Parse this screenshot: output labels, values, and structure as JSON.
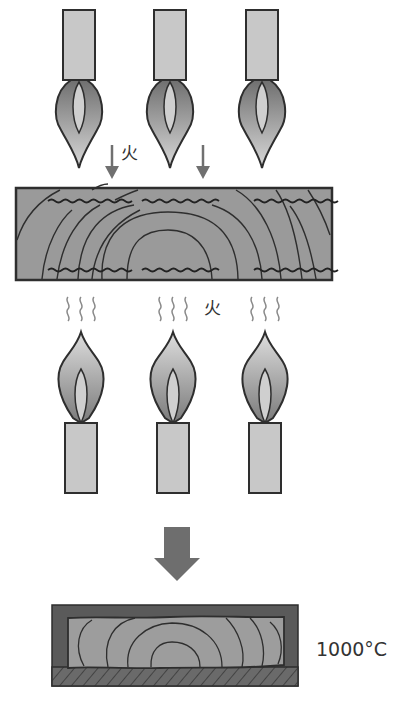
{
  "diagram": {
    "top_stage": {
      "burners": [
        {
          "id": "top-burner-1",
          "cx": 79
        },
        {
          "id": "top-burner-2",
          "cx": 170
        },
        {
          "id": "top-burner-3",
          "cx": 262
        }
      ],
      "fire_label": "火",
      "arrows": [
        {
          "x": 112
        },
        {
          "x": 203
        }
      ]
    },
    "wood_block": {
      "label": "wood plank with grain",
      "fill": "#999999"
    },
    "bottom_stage": {
      "candles": [
        {
          "id": "bottom-candle-1",
          "cx": 81
        },
        {
          "id": "bottom-candle-2",
          "cx": 173
        },
        {
          "id": "bottom-candle-3",
          "cx": 265
        }
      ],
      "fire_label": "火",
      "heat_wave_groups": 3
    },
    "transition_arrow": {
      "direction": "down",
      "color": "#6e6e6e"
    },
    "result": {
      "label": "carbonized wood",
      "temperature": "1000°C",
      "outer_color": "#5a5a5a",
      "inner_color": "#9d9d9d"
    },
    "colors": {
      "tube_fill": "#c8c8c8",
      "outline": "#2e2e2e",
      "flame_outer_top": "#d7d7d7",
      "flame_outer_bottom": "#7d7d7d",
      "flame_inner": "#cfcfcf",
      "arrow": "#707070",
      "heat_wave": "#8a8a8a",
      "wood": "#9a9a9a"
    }
  }
}
